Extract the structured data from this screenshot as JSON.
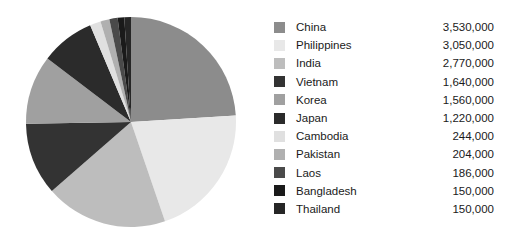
{
  "chart_data": {
    "type": "pie",
    "title": "",
    "subtitle": "",
    "xlabel": "",
    "ylabel": "",
    "legend_position": "right",
    "grid": false,
    "start_angle_deg": 0,
    "direction": "clockwise",
    "total": 15700000,
    "categories": [
      "China",
      "Philippines",
      "India",
      "Vietnam",
      "Korea",
      "Japan",
      "Cambodia",
      "Pakistan",
      "Laos",
      "Bangladesh",
      "Thailand"
    ],
    "values": [
      3530000,
      3050000,
      2770000,
      1640000,
      1560000,
      1220000,
      244000,
      204000,
      186000,
      150000,
      150000
    ],
    "value_labels": [
      "3,530,000",
      "3,050,000",
      "2,770,000",
      "1,640,000",
      "1,560,000",
      "1,220,000",
      "244,000",
      "204,000",
      "186,000",
      "150,000",
      "150,000"
    ],
    "colors": [
      "#8c8c8c",
      "#e8e8e8",
      "#bdbdbd",
      "#333333",
      "#a0a0a0",
      "#2b2b2b",
      "#e0e0e0",
      "#b0b0b0",
      "#4a4a4a",
      "#1a1a1a",
      "#262626"
    ],
    "slices": [
      {
        "label": "China",
        "value": 3530000,
        "value_label": "3,530,000",
        "color": "#8c8c8c"
      },
      {
        "label": "Philippines",
        "value": 3050000,
        "value_label": "3,050,000",
        "color": "#e8e8e8"
      },
      {
        "label": "India",
        "value": 2770000,
        "value_label": "2,770,000",
        "color": "#bdbdbd"
      },
      {
        "label": "Vietnam",
        "value": 1640000,
        "value_label": "1,640,000",
        "color": "#333333"
      },
      {
        "label": "Korea",
        "value": 1560000,
        "value_label": "1,560,000",
        "color": "#a0a0a0"
      },
      {
        "label": "Japan",
        "value": 1220000,
        "value_label": "1,220,000",
        "color": "#2b2b2b"
      },
      {
        "label": "Cambodia",
        "value": 244000,
        "value_label": "244,000",
        "color": "#e0e0e0"
      },
      {
        "label": "Pakistan",
        "value": 204000,
        "value_label": "204,000",
        "color": "#b0b0b0"
      },
      {
        "label": "Laos",
        "value": 186000,
        "value_label": "186,000",
        "color": "#4a4a4a"
      },
      {
        "label": "Bangladesh",
        "value": 150000,
        "value_label": "150,000",
        "color": "#1a1a1a"
      },
      {
        "label": "Thailand",
        "value": 150000,
        "value_label": "150,000",
        "color": "#262626"
      }
    ]
  },
  "figure": {
    "background": "#ffffff",
    "pie": {
      "center_x": 106,
      "center_y": 106,
      "radius": 105
    }
  }
}
